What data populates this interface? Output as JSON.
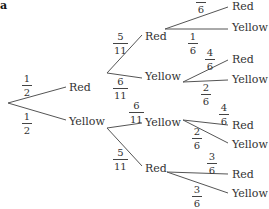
{
  "part_label": "a",
  "line_color": "#555555",
  "tree": {
    "level1": [
      {
        "outcome": "Red",
        "prob": {
          "num": "1",
          "den": "2"
        }
      },
      {
        "outcome": "Yellow",
        "prob": {
          "num": "1",
          "den": "2"
        }
      }
    ],
    "level2": [
      {
        "parent": "Red",
        "outcome": "Red",
        "prob": {
          "num": "5",
          "den": "11"
        }
      },
      {
        "parent": "Red",
        "outcome": "Yellow",
        "prob": {
          "num": "6",
          "den": "11"
        }
      },
      {
        "parent": "Yellow",
        "outcome": "Yellow",
        "prob": {
          "num": "6",
          "den": "11"
        }
      },
      {
        "parent": "Yellow",
        "outcome": "Red",
        "prob": {
          "num": "5",
          "den": "11"
        }
      }
    ],
    "level3": [
      {
        "parent": "Red-Red",
        "outcome": "Red",
        "prob": {
          "num": "5",
          "den": "6"
        }
      },
      {
        "parent": "Red-Red",
        "outcome": "Yellow",
        "prob": {
          "num": "1",
          "den": "6"
        }
      },
      {
        "parent": "Red-Yellow",
        "outcome": "Red",
        "prob": {
          "num": "4",
          "den": "6"
        }
      },
      {
        "parent": "Red-Yellow",
        "outcome": "Yellow",
        "prob": {
          "num": "2",
          "den": "6"
        }
      },
      {
        "parent": "Yellow-Yellow",
        "outcome": "Red",
        "prob": {
          "num": "4",
          "den": "6"
        }
      },
      {
        "parent": "Yellow-Yellow",
        "outcome": "Yellow",
        "prob": {
          "num": "2",
          "den": "6"
        }
      },
      {
        "parent": "Yellow-Red",
        "outcome": "Red",
        "prob": {
          "num": "3",
          "den": "6"
        }
      },
      {
        "parent": "Yellow-Red",
        "outcome": "Yellow",
        "prob": {
          "num": "3",
          "den": "6"
        }
      }
    ]
  }
}
